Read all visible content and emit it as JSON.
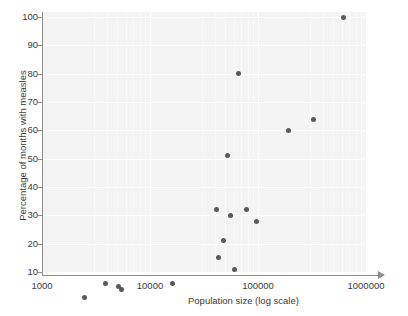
{
  "chart_data": {
    "type": "scatter",
    "title": "",
    "xlabel": "Population size (log scale)",
    "ylabel": "Percentage of months with measles",
    "xscale": "log",
    "xlim": [
      1000,
      1000000
    ],
    "ylim": [
      0,
      104
    ],
    "grid": true,
    "legend": null,
    "xticks": [
      {
        "value": 1000,
        "label": "1000"
      },
      {
        "value": 10000,
        "label": "10000"
      },
      {
        "value": 100000,
        "label": "100000"
      },
      {
        "value": 1000000,
        "label": "1000000"
      }
    ],
    "yticks": [
      {
        "value": 10,
        "label": "10"
      },
      {
        "value": 20,
        "label": "20"
      },
      {
        "value": 30,
        "label": "30"
      },
      {
        "value": 40,
        "label": "40"
      },
      {
        "value": 50,
        "label": "50"
      },
      {
        "value": 60,
        "label": "60"
      },
      {
        "value": 70,
        "label": "70"
      },
      {
        "value": 80,
        "label": "80"
      },
      {
        "value": 90,
        "label": "90"
      },
      {
        "value": 100,
        "label": "100"
      }
    ],
    "marker": {
      "shape": "circle",
      "color": "#5a5a5a",
      "size_px": 5
    },
    "colors": {
      "panel_background": "#f4f4f4",
      "gridline": "#ffffff",
      "axis": "#8d8d8d",
      "text": "#3a3a3a",
      "point": "#5a5a5a"
    },
    "points": [
      {
        "x": 2500,
        "y": 1
      },
      {
        "x": 3900,
        "y": 6
      },
      {
        "x": 5100,
        "y": 5
      },
      {
        "x": 5400,
        "y": 4
      },
      {
        "x": 16000,
        "y": 6
      },
      {
        "x": 41000,
        "y": 32
      },
      {
        "x": 43000,
        "y": 15
      },
      {
        "x": 48000,
        "y": 21
      },
      {
        "x": 52000,
        "y": 51
      },
      {
        "x": 56000,
        "y": 30
      },
      {
        "x": 61000,
        "y": 11
      },
      {
        "x": 66000,
        "y": 80
      },
      {
        "x": 78000,
        "y": 32
      },
      {
        "x": 96000,
        "y": 28
      },
      {
        "x": 190000,
        "y": 60
      },
      {
        "x": 330000,
        "y": 64
      },
      {
        "x": 620000,
        "y": 100
      }
    ]
  }
}
